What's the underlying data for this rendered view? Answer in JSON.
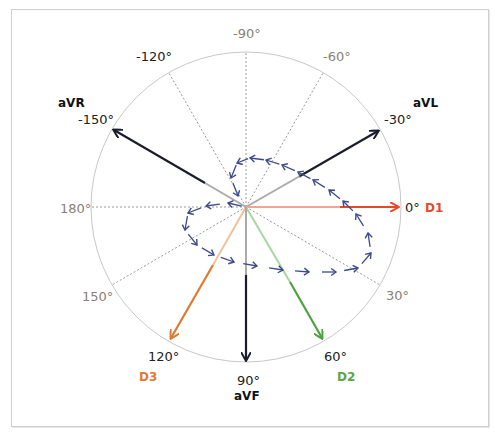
{
  "diagram": {
    "title": "",
    "type": "hexaxial-reference-system",
    "center": [
      246,
      207
    ],
    "radius": 155,
    "colors": {
      "circle": "#c8c8c8",
      "dotted_axis": "#9a9a9a",
      "lead_dark": "#1b1d2e",
      "lead_D1": "#e8482a",
      "lead_D2": "#4da23f",
      "lead_D3": "#e07a30",
      "loop_arrows": "#3d4a8a",
      "grey_label": "#8a7f76",
      "D1_label": "#e34a2a",
      "D2_label": "#5aa54a",
      "D3_label": "#e07a35"
    },
    "angle_labels": [
      {
        "id": "neg90",
        "text": "-90°"
      },
      {
        "id": "neg120",
        "text": "-120°"
      },
      {
        "id": "neg60",
        "text": "-60°"
      },
      {
        "id": "neg150",
        "text": "-150°"
      },
      {
        "id": "neg30",
        "text": "-30°"
      },
      {
        "id": "a180",
        "text": "180°"
      },
      {
        "id": "a0",
        "text": "0°"
      },
      {
        "id": "a150",
        "text": "150°"
      },
      {
        "id": "a30",
        "text": "30°"
      },
      {
        "id": "a120",
        "text": "120°"
      },
      {
        "id": "a60",
        "text": "60°"
      },
      {
        "id": "a90",
        "text": "90°"
      }
    ],
    "leads": [
      {
        "name": "aVR",
        "angle": -150,
        "color": "#1b1d2e"
      },
      {
        "name": "aVL",
        "angle": -30,
        "color": "#1b1d2e"
      },
      {
        "name": "D1",
        "angle": 0,
        "color": "#e8482a"
      },
      {
        "name": "D2",
        "angle": 60,
        "color": "#4da23f"
      },
      {
        "name": "D3",
        "angle": 120,
        "color": "#e07a30"
      },
      {
        "name": "aVF",
        "angle": 90,
        "color": "#1b1d2e"
      }
    ],
    "dotted_axes_angles": [
      -120,
      -90,
      -60,
      30,
      150,
      180
    ],
    "lead_labels": {
      "aVR": "aVR",
      "aVL": "aVL",
      "D1": "D1",
      "D2": "D2",
      "D3": "D3",
      "aVF": "aVF"
    },
    "loop_points": [
      [
        246,
        207
      ],
      [
        228,
        203
      ],
      [
        206,
        206
      ],
      [
        188,
        213
      ],
      [
        185,
        230
      ],
      [
        197,
        245
      ],
      [
        214,
        255
      ],
      [
        234,
        262
      ],
      [
        257,
        266
      ],
      [
        283,
        270
      ],
      [
        309,
        272
      ],
      [
        336,
        272
      ],
      [
        358,
        268
      ],
      [
        371,
        253
      ],
      [
        368,
        233
      ],
      [
        356,
        214
      ],
      [
        343,
        201
      ],
      [
        329,
        190
      ],
      [
        313,
        180
      ],
      [
        298,
        172
      ],
      [
        282,
        165
      ],
      [
        266,
        160
      ],
      [
        250,
        158
      ],
      [
        237,
        163
      ],
      [
        231,
        178
      ],
      [
        238,
        196
      ],
      [
        246,
        207
      ]
    ]
  }
}
